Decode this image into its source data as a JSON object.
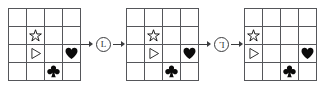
{
  "diagram": {
    "type": "grid-transformation-sequence",
    "grid": {
      "rows": 4,
      "cols": 4
    },
    "symbol_names": {
      "star": "star-outline-icon",
      "triangle": "triangle-right-outline-icon",
      "heart": "heart-filled-icon",
      "club": "club-filled-icon"
    },
    "frames": [
      {
        "label": "frame-1",
        "cells": [
          {
            "row": 2,
            "col": 2,
            "symbol": "star"
          },
          {
            "row": 3,
            "col": 2,
            "symbol": "triangle"
          },
          {
            "row": 3,
            "col": 4,
            "symbol": "heart"
          },
          {
            "row": 4,
            "col": 3,
            "symbol": "club"
          }
        ]
      },
      {
        "label": "frame-2",
        "cells": [
          {
            "row": 2,
            "col": 2,
            "symbol": "star"
          },
          {
            "row": 3,
            "col": 2,
            "symbol": "triangle"
          },
          {
            "row": 3,
            "col": 4,
            "symbol": "heart"
          },
          {
            "row": 4,
            "col": 3,
            "symbol": "club"
          }
        ]
      },
      {
        "label": "frame-3",
        "cells": [
          {
            "row": 2,
            "col": 1,
            "symbol": "star"
          },
          {
            "row": 3,
            "col": 1,
            "symbol": "triangle"
          },
          {
            "row": 3,
            "col": 4,
            "symbol": "heart"
          },
          {
            "row": 4,
            "col": 3,
            "symbol": "club"
          }
        ]
      }
    ],
    "operators": [
      {
        "label": "L",
        "rotated": false
      },
      {
        "label": "L",
        "rotated": true
      }
    ],
    "colors": {
      "grid_line": "#55565a",
      "symbol_fill": "#0a0a0a",
      "arrow": "#3a3b3e",
      "background": "#ffffff"
    }
  }
}
